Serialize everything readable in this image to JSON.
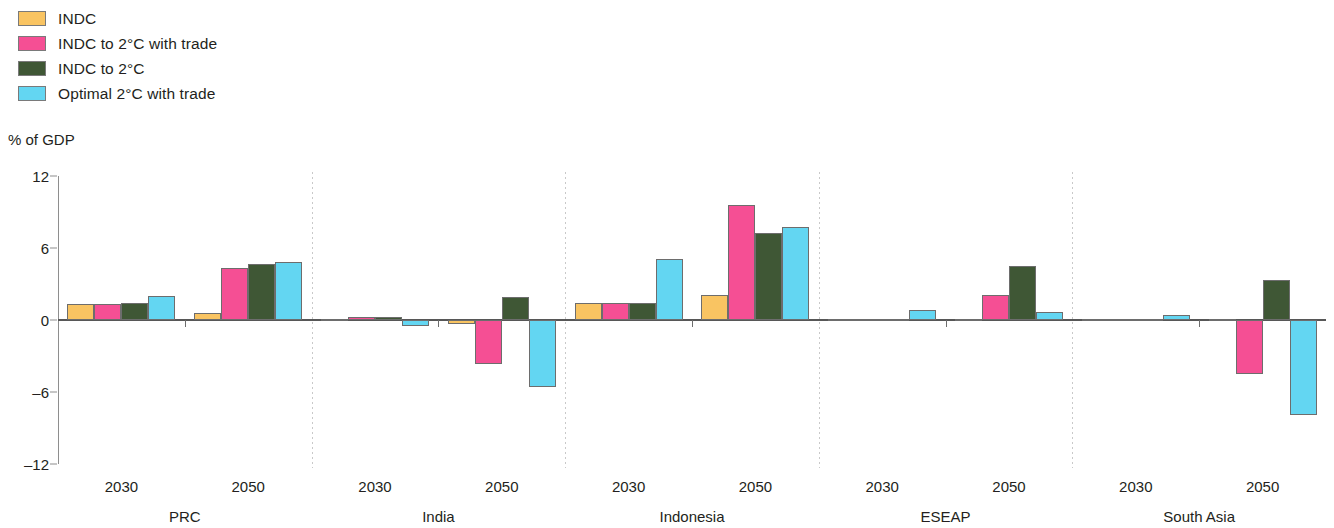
{
  "axis_title": "% of GDP",
  "legend": [
    {
      "label": "INDC",
      "color": "#f9c462"
    },
    {
      "label": "INDC to 2°C with trade",
      "color": "#f54f94"
    },
    {
      "label": "INDC to 2°C",
      "color": "#3f5735"
    },
    {
      "label": "Optimal 2°C with trade",
      "color": "#63d6f2"
    }
  ],
  "chart_data": {
    "type": "bar",
    "title": "",
    "xlabel": "",
    "ylabel": "% of GDP",
    "ylim": [
      -12,
      12
    ],
    "yticks": [
      12,
      6,
      0,
      -6,
      -12
    ],
    "ytick_labels": [
      "12",
      "6",
      "0",
      "–6",
      "–12"
    ],
    "grid": false,
    "legend_position": "top-left",
    "categories": [
      "PRC 2030",
      "PRC 2050",
      "India 2030",
      "India 2050",
      "Indonesia 2030",
      "Indonesia 2050",
      "ESEAP 2030",
      "ESEAP 2050",
      "South Asia 2030",
      "South Asia 2050"
    ],
    "groups": [
      {
        "name": "PRC",
        "years": [
          "2030",
          "2050"
        ]
      },
      {
        "name": "India",
        "years": [
          "2030",
          "2050"
        ]
      },
      {
        "name": "Indonesia",
        "years": [
          "2030",
          "2050"
        ]
      },
      {
        "name": "ESEAP",
        "years": [
          "2030",
          "2050"
        ]
      },
      {
        "name": "South Asia",
        "years": [
          "2030",
          "2050"
        ]
      }
    ],
    "series": [
      {
        "name": "INDC",
        "color": "#f9c462",
        "values": [
          1.3,
          0.6,
          0.05,
          -0.35,
          1.4,
          2.1,
          0.05,
          0.0,
          0.1,
          0.0
        ]
      },
      {
        "name": "INDC to 2°C with trade",
        "color": "#f54f94",
        "values": [
          1.3,
          4.3,
          0.25,
          -3.7,
          1.4,
          9.6,
          0.05,
          2.1,
          0.1,
          -4.5
        ]
      },
      {
        "name": "INDC to 2°C",
        "color": "#3f5735",
        "values": [
          1.4,
          4.7,
          0.25,
          1.9,
          1.4,
          7.25,
          0.05,
          4.5,
          0.1,
          3.3
        ]
      },
      {
        "name": "Optimal 2°C with trade",
        "color": "#63d6f2",
        "values": [
          2.0,
          4.8,
          -0.5,
          -5.6,
          5.1,
          7.75,
          0.85,
          0.7,
          0.45,
          -7.9
        ]
      }
    ]
  }
}
